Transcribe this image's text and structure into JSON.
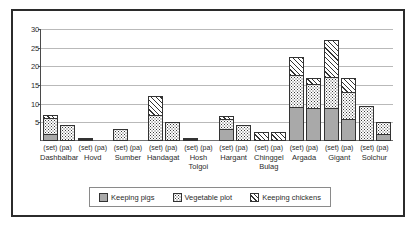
{
  "chart_data": {
    "type": "bar",
    "subtype": "stacked-bar",
    "title": "",
    "xlabel": "",
    "ylabel": "",
    "ylim": [
      0,
      30
    ],
    "ytick_labels": [
      "5",
      "10",
      "15",
      "20",
      "25",
      "30"
    ],
    "yticks": [
      5,
      10,
      15,
      20,
      25,
      30
    ],
    "grid": true,
    "legend_position": "bottom",
    "categories": [
      "Dashbalbar (set)",
      "Dashbalbar (pa)",
      "Hovd (set)",
      "Hovd (pa)",
      "Sumber (set)",
      "Sumber (pa)",
      "Handagat (set)",
      "Handagat (pa)",
      "Hosh Tolgoi (set)",
      "Hosh Tolgoi (pa)",
      "Hargant (set)",
      "Hargant (pa)",
      "Chinggel Bulag (set)",
      "Chinggel Bulag (pa)",
      "Argada (set)",
      "Argada (pa)",
      "Gigant (set)",
      "Gigant (pa)",
      "Solchur (set)",
      "Solchur (pa)"
    ],
    "groups": [
      {
        "name": "Dashbalbar",
        "subs": [
          "(set)",
          "(pa)"
        ]
      },
      {
        "name": "Hovd",
        "subs": [
          "(set)",
          "(pa)"
        ]
      },
      {
        "name": "Sumber",
        "subs": [
          "(set)",
          "(pa)"
        ]
      },
      {
        "name": "Handagat",
        "subs": [
          "(set)",
          "(pa)"
        ]
      },
      {
        "name": "Hosh Tolgoi",
        "subs": [
          "(set)",
          "(pa)"
        ]
      },
      {
        "name": "Hargant",
        "subs": [
          "(set)",
          "(pa)"
        ]
      },
      {
        "name": "Chinggel Bulag",
        "subs": [
          "(set)",
          "(pa)"
        ]
      },
      {
        "name": "Argada",
        "subs": [
          "(set)",
          "(pa)"
        ]
      },
      {
        "name": "Gigant",
        "subs": [
          "(set)",
          "(pa)"
        ]
      },
      {
        "name": "Solchur",
        "subs": [
          "(set)",
          "(pa)"
        ]
      }
    ],
    "series": [
      {
        "name": "Keeping pigs",
        "pattern": "solid-gray",
        "color": "#a9a9a9",
        "values": [
          2.0,
          0.0,
          0.0,
          0.0,
          0.0,
          0.0,
          0.0,
          0.0,
          0.0,
          0.0,
          3.2,
          0.0,
          0.0,
          0.0,
          9.0,
          8.8,
          8.8,
          6.0,
          0.0,
          1.8
        ]
      },
      {
        "name": "Vegetable plot",
        "pattern": "dotted",
        "color": "#ffffff",
        "values": [
          4.2,
          4.2,
          0.4,
          0.0,
          3.2,
          0.0,
          7.0,
          5.2,
          0.5,
          0.0,
          2.8,
          4.4,
          0.0,
          0.0,
          8.6,
          6.4,
          8.4,
          7.2,
          9.4,
          3.2
        ]
      },
      {
        "name": "Keeping chickens",
        "pattern": "diagonal-hatch",
        "color": "#ffffff",
        "values": [
          0.7,
          0.0,
          0.3,
          0.0,
          0.0,
          0.0,
          5.0,
          0.0,
          0.3,
          0.0,
          0.7,
          0.0,
          2.4,
          2.4,
          5.0,
          1.6,
          9.8,
          3.6,
          0.0,
          0.0
        ]
      }
    ],
    "totals": [
      6.9,
      4.2,
      0.7,
      0.0,
      3.2,
      0.0,
      12.0,
      5.2,
      0.8,
      0.0,
      6.7,
      4.4,
      2.4,
      2.4,
      22.6,
      16.8,
      27.0,
      16.8,
      9.4,
      5.0
    ]
  },
  "legend": {
    "items": [
      {
        "label": "Keeping pigs",
        "swatch": "solid-gray-swatch"
      },
      {
        "label": "Vegetable plot",
        "swatch": "dotted-swatch"
      },
      {
        "label": "Keeping chickens",
        "swatch": "hatch-swatch"
      }
    ]
  }
}
